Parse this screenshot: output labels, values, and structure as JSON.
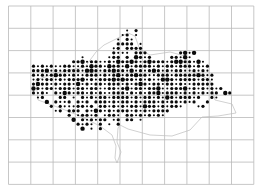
{
  "map": {
    "title": "",
    "type": "distribution-dot-map",
    "grid": {
      "columns": 11,
      "rows": 8
    },
    "legend_levels": [
      "absent",
      "small",
      "medium",
      "large"
    ],
    "dot_color": "#0a0a0a",
    "grid_color": "#b9b9b9",
    "occurrence_rows": [
      ".......................................................",
      ".......................................................",
      ".......................................................",
      ".......................................................",
      ".......................................................",
      "...........................1.2..........................",
      "..........................12.1..........................",
      ".........................1.21...........................",
      ".........................2222.1.........................",
      "........................12.2222..........................",
      "........................2111.222.......2313..............",
      ".................1.....122.2.3212....22131..............",
      "...............223122112132232123222123322131...........",
      "......2121211221121322132213122221212212221212...........",
      "......2223121222213321223221312123212122112121...........",
      "......21212322121122212123122322112221222223212..........",
      "......12122121222312122232322121211332122221221.........",
      "......23221212213121221222121232122122121122222..........",
      "......3212212221221221122123122122311222312121212........",
      "......2121.2132122121211222121212231222121212122.32......",
      ".......12...22.1.212122122221212212132122212..21.........",
      ".........3.2112.212.22212122121222121221212..2...........",
      "..........2.21112212.2212121221322121221...12............",
      "...........12.222.2132121222121212222.....................",
      "..............2.12212.1221.221212121.......................",
      "...............3.212122.12.22.1.........................",
      "................2121.2.1.2..............................",
      ".................3.1.2...................................",
      "......................................................."
    ]
  }
}
